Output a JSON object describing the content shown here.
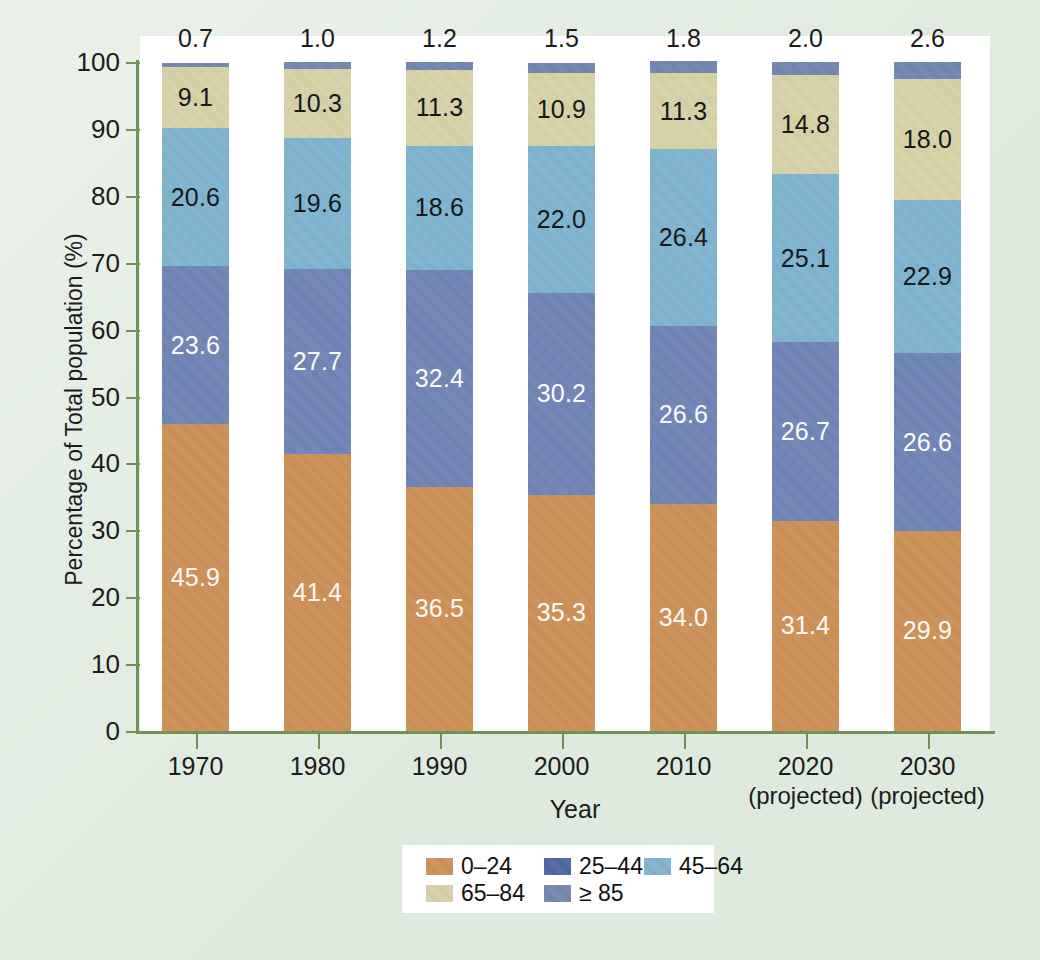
{
  "chart_data": {
    "type": "bar",
    "subtype": "stacked-bar-100-percent",
    "title": "",
    "xlabel": "Year",
    "ylabel": "Percentage of Total population (%)",
    "ylim": [
      0,
      100
    ],
    "yticks": [
      0,
      10,
      20,
      30,
      40,
      50,
      60,
      70,
      80,
      90,
      100
    ],
    "grid": false,
    "legend_position": "bottom-center",
    "categories": [
      "1970",
      "1980",
      "1990",
      "2000",
      "2010",
      "2020",
      "2030"
    ],
    "category_sublabels": [
      "",
      "",
      "",
      "",
      "",
      "(projected)",
      "(projected)"
    ],
    "series": [
      {
        "name": "0–24",
        "color": "#cd9156",
        "label_color": "#ffffff",
        "values": [
          45.9,
          41.4,
          36.5,
          35.3,
          34.0,
          31.4,
          29.9
        ]
      },
      {
        "name": "25–44",
        "color": "#6f85b7",
        "label_color": "#ffffff",
        "values": [
          23.6,
          27.7,
          32.4,
          30.2,
          26.6,
          26.7,
          26.6
        ]
      },
      {
        "name": "45–64",
        "color": "#7fb4d0",
        "label_color": "#111111",
        "values": [
          20.6,
          19.6,
          18.6,
          22.0,
          26.4,
          25.1,
          22.9
        ]
      },
      {
        "name": "65–84",
        "color": "#d8d3a8",
        "label_color": "#111111",
        "values": [
          9.1,
          10.3,
          11.3,
          10.9,
          11.3,
          14.8,
          18.0
        ]
      },
      {
        "name": "≥ 85",
        "color": "#7286b0",
        "label_color": "#1c1c1c",
        "values": [
          0.7,
          1.0,
          1.2,
          1.5,
          1.8,
          2.0,
          2.6
        ],
        "labels_outside_top": true
      }
    ]
  },
  "axis": {
    "y_title": "Percentage of Total population (%)",
    "x_title": "Year",
    "y_tick_labels": [
      "100",
      "90",
      "80",
      "70",
      "60",
      "50",
      "40",
      "30",
      "20",
      "10",
      "0"
    ],
    "axis_color": "#6e9355"
  },
  "legend": {
    "rows": [
      [
        {
          "label": "0–24",
          "color": "#cd9156"
        },
        {
          "label": "25–44",
          "color": "#4a64a3"
        },
        {
          "label": "45–64",
          "color": "#7fb4d0"
        }
      ],
      [
        {
          "label": "65–84",
          "color": "#d8d3a8"
        },
        {
          "label": "≥ 85",
          "color": "#7286b0"
        }
      ]
    ]
  },
  "figure": {
    "background_color": "#dfeade",
    "plot_background_color": "#ffffff"
  }
}
